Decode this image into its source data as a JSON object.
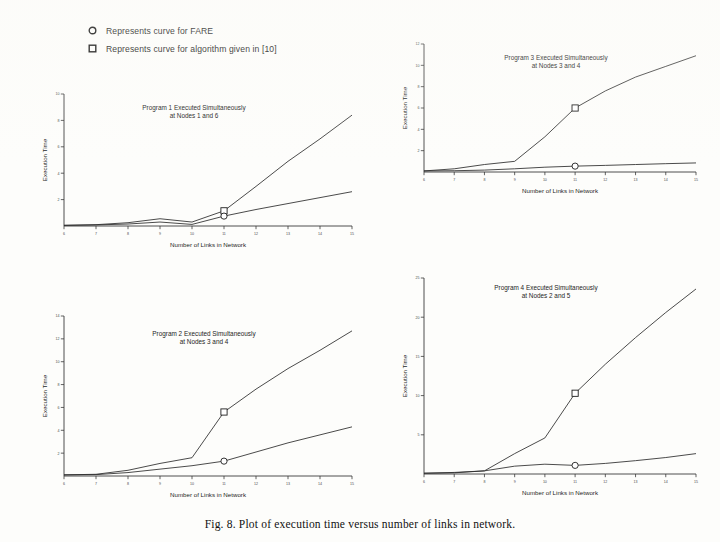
{
  "figure": {
    "caption": "Fig. 8.  Plot of execution time versus number of links in network."
  },
  "legend": {
    "position": "top-left",
    "items": [
      {
        "marker": "circle-marker-icon",
        "label": "Represents curve for FARE"
      },
      {
        "marker": "square-marker-icon",
        "label": "Represents curve for algorithm given in [10]"
      }
    ]
  },
  "chart_data": [
    {
      "id": "panel-1",
      "type": "line",
      "title": "Program 1 Executed Simultaneously\nat Nodes 1 and 6",
      "title_line1": "Program 1 Executed Simultaneously",
      "title_line2": "at Nodes 1 and 6",
      "xlabel": "Number of Links in Network",
      "ylabel": "Execution Time",
      "x": [
        6,
        7,
        8,
        9,
        10,
        11,
        12,
        13,
        14,
        15
      ],
      "xticklabels": [
        "6",
        "7",
        "8",
        "9",
        "10",
        "11",
        "12",
        "13",
        "14",
        "15"
      ],
      "xlim": [
        6,
        15
      ],
      "ylim": [
        0,
        10
      ],
      "yticklabels": [
        "2",
        "4",
        "6",
        "8",
        "10"
      ],
      "yticks": [
        2,
        4,
        6,
        8,
        10
      ],
      "grid": false,
      "series": [
        {
          "name": "algorithm given in [10]",
          "marker": "square",
          "marker_at_x": 11,
          "values": [
            0.05,
            0.1,
            0.25,
            0.55,
            0.3,
            1.15,
            3.0,
            4.9,
            6.6,
            8.4
          ]
        },
        {
          "name": "FARE",
          "marker": "circle",
          "marker_at_x": 11,
          "values": [
            0.05,
            0.08,
            0.15,
            0.3,
            0.12,
            0.75,
            1.25,
            1.7,
            2.15,
            2.6
          ]
        }
      ]
    },
    {
      "id": "panel-3",
      "type": "line",
      "title": "Program 3 Executed Simultaneously\nat Nodes 3 and 4",
      "title_line1": "Program 3 Executed Simultaneously",
      "title_line2": "at Nodes 3 and 4",
      "xlabel": "Number of Links in Network",
      "ylabel": "Execution Time",
      "x": [
        6,
        7,
        8,
        9,
        10,
        11,
        12,
        13,
        14,
        15
      ],
      "xticklabels": [
        "6",
        "7",
        "8",
        "9",
        "10",
        "11",
        "12",
        "13",
        "14",
        "15"
      ],
      "xlim": [
        6,
        15
      ],
      "ylim": [
        0,
        12
      ],
      "yticklabels": [
        "2",
        "4",
        "6",
        "8",
        "10",
        "12"
      ],
      "yticks": [
        2,
        4,
        6,
        8,
        10,
        12
      ],
      "grid": false,
      "series": [
        {
          "name": "algorithm given in [10]",
          "marker": "square",
          "marker_at_x": 11,
          "values": [
            0.1,
            0.3,
            0.7,
            1.0,
            3.3,
            6.0,
            7.6,
            8.9,
            9.9,
            10.9
          ]
        },
        {
          "name": "FARE",
          "marker": "circle",
          "marker_at_x": 11,
          "values": [
            0.1,
            0.12,
            0.18,
            0.3,
            0.45,
            0.55,
            0.62,
            0.7,
            0.78,
            0.85
          ]
        }
      ]
    },
    {
      "id": "panel-2",
      "type": "line",
      "title": "Program 2 Executed Simultaneously\nat Nodes 3 and 4",
      "title_line1": "Program 2 Executed Simultaneously",
      "title_line2": "at Nodes 3 and 4",
      "xlabel": "Number of Links in Network",
      "ylabel": "Execution Time",
      "x": [
        6,
        7,
        8,
        9,
        10,
        11,
        12,
        13,
        14,
        15
      ],
      "xticklabels": [
        "6",
        "7",
        "8",
        "9",
        "10",
        "11",
        "12",
        "13",
        "14",
        "15"
      ],
      "xlim": [
        6,
        15
      ],
      "ylim": [
        0,
        14
      ],
      "yticklabels": [
        "2",
        "4",
        "6",
        "8",
        "10",
        "12",
        "14"
      ],
      "yticks": [
        2,
        4,
        6,
        8,
        10,
        12,
        14
      ],
      "grid": false,
      "series": [
        {
          "name": "algorithm given in [10]",
          "marker": "square",
          "marker_at_x": 11,
          "values": [
            0.1,
            0.15,
            0.5,
            1.1,
            1.6,
            5.6,
            7.6,
            9.4,
            11.0,
            12.7
          ]
        },
        {
          "name": "FARE",
          "marker": "circle",
          "marker_at_x": 11,
          "values": [
            0.1,
            0.12,
            0.3,
            0.6,
            0.9,
            1.3,
            2.1,
            2.9,
            3.6,
            4.3
          ]
        }
      ]
    },
    {
      "id": "panel-4",
      "type": "line",
      "title": "Program 4 Executed Simultaneously\nat Nodes 2 and 5",
      "title_line1": "Program 4 Executed Simultaneously",
      "title_line2": "at Nodes 2 and 5",
      "xlabel": "Number of Links in Network",
      "ylabel": "Execution Time",
      "x": [
        6,
        7,
        8,
        9,
        10,
        11,
        12,
        13,
        14,
        15
      ],
      "xticklabels": [
        "6",
        "7",
        "8",
        "9",
        "10",
        "11",
        "12",
        "13",
        "14",
        "15"
      ],
      "xlim": [
        6,
        15
      ],
      "ylim": [
        0,
        25
      ],
      "yticklabels": [
        "5",
        "10",
        "15",
        "20",
        "25"
      ],
      "yticks": [
        5,
        10,
        15,
        20,
        25
      ],
      "grid": false,
      "series": [
        {
          "name": "algorithm given in [10]",
          "marker": "square",
          "marker_at_x": 11,
          "values": [
            0.1,
            0.2,
            0.4,
            2.6,
            4.6,
            10.3,
            14.0,
            17.4,
            20.6,
            23.6
          ]
        },
        {
          "name": "FARE",
          "marker": "circle",
          "marker_at_x": 11,
          "values": [
            0.1,
            0.15,
            0.4,
            1.0,
            1.25,
            1.1,
            1.35,
            1.7,
            2.1,
            2.6
          ]
        }
      ]
    }
  ]
}
